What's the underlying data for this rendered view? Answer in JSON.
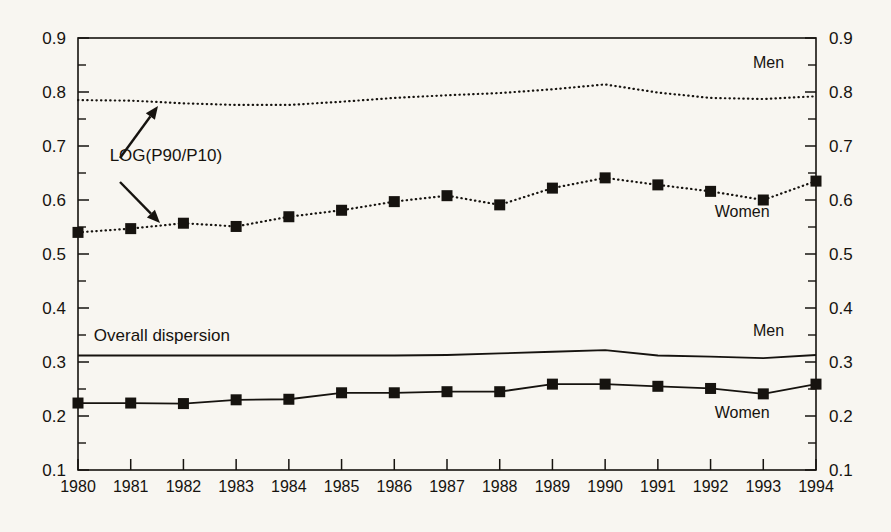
{
  "chart_data": {
    "type": "line",
    "title": "",
    "subtitle": "",
    "xlabel": "",
    "ylabel": "",
    "xlim": [
      1980,
      1994
    ],
    "ylim": [
      0.1,
      0.9
    ],
    "grid": false,
    "legend_position": "inline-right",
    "x": [
      1980,
      1981,
      1982,
      1983,
      1984,
      1985,
      1986,
      1987,
      1988,
      1989,
      1990,
      1991,
      1992,
      1993,
      1994
    ],
    "y_ticks": [
      "0.1",
      "0.2",
      "0.3",
      "0.4",
      "0.5",
      "0.6",
      "0.7",
      "0.8",
      "0.9"
    ],
    "y_tick_values": [
      0.1,
      0.2,
      0.3,
      0.4,
      0.5,
      0.6,
      0.7,
      0.8,
      0.9
    ],
    "y_minor_tick_values": [
      0.15,
      0.25,
      0.35,
      0.45,
      0.55,
      0.65,
      0.75,
      0.85
    ],
    "x_ticks": [
      "1980",
      "1981",
      "1982",
      "1983",
      "1984",
      "1985",
      "1986",
      "1987",
      "1988",
      "1989",
      "1990",
      "1991",
      "1992",
      "1993",
      "1994"
    ],
    "series": [
      {
        "name": "Men",
        "group": "LOG(P90/P10)",
        "style": "dotted",
        "markers": false,
        "label": "Men",
        "values": [
          0.785,
          0.784,
          0.779,
          0.776,
          0.776,
          0.782,
          0.789,
          0.794,
          0.798,
          0.805,
          0.814,
          0.799,
          0.789,
          0.787,
          0.792
        ]
      },
      {
        "name": "Women",
        "group": "LOG(P90/P10)",
        "style": "dotted",
        "markers": true,
        "label": "Women",
        "values": [
          0.54,
          0.547,
          0.557,
          0.551,
          0.569,
          0.581,
          0.597,
          0.608,
          0.591,
          0.622,
          0.641,
          0.628,
          0.616,
          0.6,
          0.635
        ]
      },
      {
        "name": "Men",
        "group": "Overall dispersion",
        "style": "solid",
        "markers": false,
        "label": "Men",
        "values": [
          0.312,
          0.312,
          0.312,
          0.312,
          0.312,
          0.312,
          0.312,
          0.313,
          0.316,
          0.319,
          0.322,
          0.312,
          0.31,
          0.307,
          0.313
        ]
      },
      {
        "name": "Women",
        "group": "Overall dispersion",
        "style": "solid",
        "markers": true,
        "label": "Women",
        "values": [
          0.224,
          0.224,
          0.223,
          0.23,
          0.231,
          0.243,
          0.243,
          0.245,
          0.245,
          0.259,
          0.259,
          0.255,
          0.251,
          0.241,
          0.259
        ]
      }
    ],
    "annotations": [
      {
        "id": "log-p90-p10",
        "text": "LOG(P90/P10)",
        "x": 1980.6,
        "y": 0.672,
        "arrows": [
          "up-right-to-men-dotted",
          "down-right-to-women-dotted"
        ]
      },
      {
        "id": "overall-dispersion",
        "text": "Overall dispersion",
        "x": 1980.3,
        "y": 0.338,
        "arrows": []
      }
    ],
    "inline_labels": [
      {
        "id": "men-dotted-label",
        "text": "Men",
        "x": 1993.1,
        "y": 0.845
      },
      {
        "id": "women-dotted-label",
        "text": "Women",
        "x": 1992.6,
        "y": 0.569
      },
      {
        "id": "men-solid-label",
        "text": "Men",
        "x": 1993.1,
        "y": 0.348
      },
      {
        "id": "women-solid-label",
        "text": "Women",
        "x": 1992.6,
        "y": 0.196
      }
    ],
    "colors": {
      "ink": "#16130f",
      "background": "#f8f6f1"
    }
  }
}
